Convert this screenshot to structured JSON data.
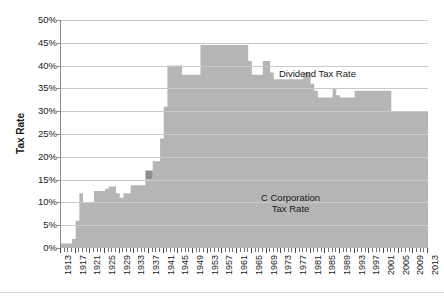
{
  "chart_data": {
    "type": "area",
    "stacked": true,
    "title": "",
    "xlabel": "",
    "ylabel": "Tax Rate",
    "ylim": [
      0,
      50
    ],
    "ytick_labels": [
      "0%",
      "5%",
      "10%",
      "15%",
      "20%",
      "25%",
      "30%",
      "35%",
      "40%",
      "45%",
      "50%"
    ],
    "ytick_values": [
      0,
      5,
      10,
      15,
      20,
      25,
      30,
      35,
      40,
      45,
      50
    ],
    "xlim": [
      1913,
      2013
    ],
    "xtick_labels": [
      "1913",
      "1917",
      "1921",
      "1925",
      "1929",
      "1933",
      "1937",
      "1941",
      "1945",
      "1949",
      "1953",
      "1957",
      "1961",
      "1965",
      "1969",
      "1973",
      "1977",
      "1981",
      "1985",
      "1989",
      "1993",
      "1997",
      "2001",
      "2005",
      "2009",
      "2013"
    ],
    "xtick_step": 4,
    "grid": true,
    "legend_position": "inline-annotation",
    "annotations": [
      {
        "text": "Dividend Tax Rate",
        "x": 1955,
        "y": 41
      },
      {
        "text": "C Corporation",
        "x": 1957,
        "y": 17
      },
      {
        "text": "Tax Rate",
        "x": 1957,
        "y": 15
      }
    ],
    "colors": {
      "c_corporation": "#b5b5b5",
      "dividend": "#8e8e8e",
      "gridline": "#c9c9c9",
      "axis": "#8a8a8a",
      "text": "#1a1a1a"
    },
    "x": [
      1913,
      1914,
      1915,
      1916,
      1917,
      1918,
      1919,
      1920,
      1921,
      1922,
      1923,
      1924,
      1925,
      1926,
      1927,
      1928,
      1929,
      1930,
      1931,
      1932,
      1933,
      1934,
      1935,
      1936,
      1937,
      1938,
      1939,
      1940,
      1941,
      1942,
      1943,
      1944,
      1945,
      1946,
      1947,
      1948,
      1949,
      1950,
      1951,
      1952,
      1953,
      1954,
      1955,
      1956,
      1957,
      1958,
      1959,
      1960,
      1961,
      1962,
      1963,
      1964,
      1965,
      1966,
      1967,
      1968,
      1969,
      1970,
      1971,
      1972,
      1973,
      1974,
      1975,
      1976,
      1977,
      1978,
      1979,
      1980,
      1981,
      1982,
      1983,
      1984,
      1985,
      1986,
      1987,
      1988,
      1989,
      1990,
      1991,
      1992,
      1993,
      1994,
      1995,
      1996,
      1997,
      1998,
      1999,
      2000,
      2001,
      2002,
      2003,
      2004,
      2005,
      2006,
      2007,
      2008,
      2009,
      2010,
      2011,
      2012,
      2013
    ],
    "series": [
      {
        "name": "C Corporation Tax Rate",
        "color": "#b5b5b5",
        "values": [
          1.0,
          1.0,
          1.0,
          2.0,
          6.0,
          12.0,
          10.0,
          10.0,
          10.0,
          12.5,
          12.5,
          12.5,
          13.0,
          13.5,
          13.5,
          12.0,
          11.0,
          12.0,
          12.0,
          13.75,
          13.75,
          13.75,
          13.75,
          15.0,
          15.0,
          19.0,
          19.0,
          24.0,
          31.0,
          40.0,
          40.0,
          40.0,
          40.0,
          38.0,
          38.0,
          38.0,
          38.0,
          38.0,
          50.75,
          52.0,
          52.0,
          52.0,
          52.0,
          52.0,
          52.0,
          52.0,
          52.0,
          52.0,
          52.0,
          52.0,
          52.0,
          50.0,
          48.0,
          48.0,
          48.0,
          52.8,
          52.8,
          49.2,
          48.0,
          48.0,
          48.0,
          48.0,
          48.0,
          48.0,
          48.0,
          48.0,
          46.0,
          46.0,
          46.0,
          46.0,
          46.0,
          46.0,
          46.0,
          46.0,
          40.0,
          34.0,
          34.0,
          34.0,
          34.0,
          34.0,
          35.0,
          35.0,
          35.0,
          35.0,
          35.0,
          35.0,
          35.0,
          35.0,
          35.0,
          35.0,
          35.0,
          35.0,
          35.0,
          35.0,
          35.0,
          35.0,
          35.0,
          35.0,
          35.0,
          35.0,
          35.0
        ]
      },
      {
        "name": "Dividend Tax Rate",
        "color": "#8e8e8e",
        "values": [
          0.0,
          0.0,
          0.0,
          0.0,
          0.0,
          0.0,
          0.0,
          0.0,
          0.0,
          0.0,
          0.0,
          0.0,
          0.0,
          0.0,
          0.0,
          0.0,
          0.0,
          0.0,
          0.0,
          0.0,
          0.0,
          0.0,
          0.0,
          4.0,
          4.0,
          0.0,
          0.0,
          0.0,
          0.0,
          0.0,
          0.0,
          0.0,
          0.0,
          0.0,
          0.0,
          0.0,
          0.0,
          0.0,
          0.0,
          0.0,
          0.0,
          0.0,
          0.0,
          0.0,
          0.0,
          0.0,
          0.0,
          0.0,
          0.0,
          0.0,
          0.0,
          0.0,
          0.0,
          0.0,
          0.0,
          0.0,
          0.0,
          0.0,
          0.0,
          0.0,
          0.0,
          0.0,
          0.0,
          0.0,
          0.0,
          0.0,
          0.0,
          0.0,
          0.0,
          0.0,
          0.0,
          0.0,
          0.0,
          0.0,
          0.0,
          0.0,
          0.0,
          0.0,
          0.0,
          0.0,
          0.0,
          0.0,
          0.0,
          0.0,
          0.0,
          0.0,
          0.0,
          0.0,
          0.0,
          0.0,
          0.0,
          0.0,
          0.0,
          0.0,
          0.0,
          0.0,
          0.0,
          0.0,
          0.0,
          0.0,
          0.0
        ]
      }
    ],
    "combined_total": {
      "name": "Total integrated rate (C Corp + Dividend)",
      "description": "Upper boundary of the stacked area: combined corporate and shareholder-level dividend tax burden",
      "values": [
        1.0,
        1.0,
        1.0,
        2.0,
        6.0,
        12.0,
        10.0,
        10.0,
        10.0,
        12.5,
        12.5,
        12.5,
        13.0,
        13.5,
        13.5,
        12.0,
        11.0,
        12.0,
        12.0,
        13.75,
        13.75,
        13.75,
        13.75,
        17.0,
        17.0,
        19.0,
        19.0,
        24.0,
        31.0,
        40.0,
        40.0,
        40.0,
        40.0,
        38.0,
        38.0,
        38.0,
        38.0,
        38.0,
        44.5,
        44.5,
        44.5,
        44.5,
        44.5,
        44.5,
        44.5,
        44.5,
        44.5,
        44.5,
        44.5,
        44.5,
        44.5,
        41.0,
        38.0,
        38.0,
        38.0,
        41.0,
        41.0,
        38.5,
        37.0,
        37.0,
        37.0,
        37.0,
        37.0,
        37.0,
        37.0,
        37.0,
        38.5,
        38.5,
        36.0,
        34.5,
        33.0,
        33.0,
        33.0,
        33.0,
        35.0,
        33.5,
        33.0,
        33.0,
        33.0,
        33.0,
        34.5,
        34.5,
        34.5,
        34.5,
        34.5,
        34.5,
        34.5,
        34.5,
        34.5,
        34.5,
        30.0,
        30.0,
        30.0,
        30.0,
        30.0,
        30.0,
        30.0,
        30.0,
        30.0,
        30.0,
        36.0
      ]
    },
    "axis_rendering_note": "Dividend band is drawn as the region between the C-Corporation curve and the combined total curve; where the total equals the C-Corp value the dividend band has zero thickness."
  },
  "ui": {
    "ylabel_text": "Tax Rate",
    "dividend_label": "Dividend Tax Rate",
    "ccorp_label_line1": "C Corporation",
    "ccorp_label_line2": "Tax Rate"
  }
}
